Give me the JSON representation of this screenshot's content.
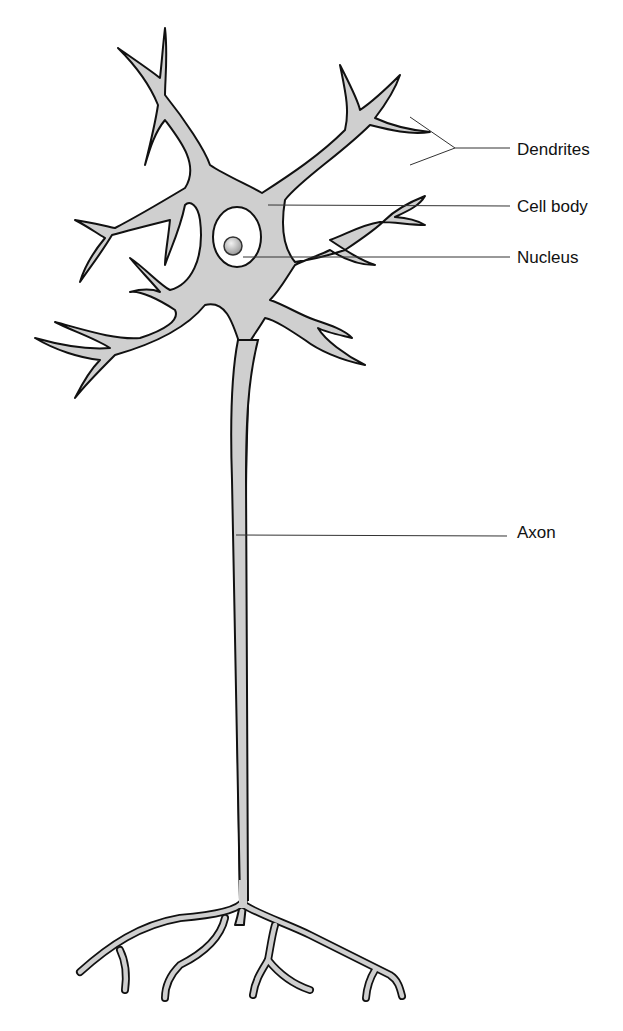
{
  "diagram": {
    "type": "labeled-illustration",
    "colors": {
      "background": "#ffffff",
      "cell_fill": "#cfcfcf",
      "outline": "#111111",
      "nucleus_region": "#ffffff",
      "nucleolus": "#b8b8b8",
      "leader_line": "#333333"
    },
    "labels": [
      {
        "id": "dendrites",
        "text": "Dendrites",
        "x": 517,
        "y": 141
      },
      {
        "id": "cell-body",
        "text": "Cell body",
        "x": 517,
        "y": 198
      },
      {
        "id": "nucleus",
        "text": "Nucleus",
        "x": 517,
        "y": 250
      },
      {
        "id": "axon",
        "text": "Axon",
        "x": 517,
        "y": 523
      }
    ]
  }
}
